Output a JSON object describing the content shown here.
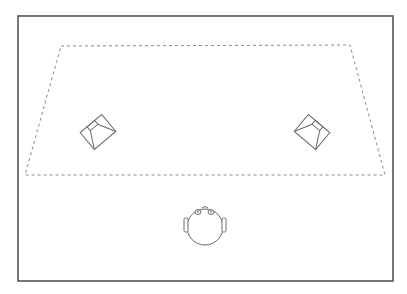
{
  "diagram": {
    "title": "",
    "type": "stereo listening setup (top view)",
    "colors": {
      "background": "#ffffff",
      "room_border": "#555555",
      "dashed_area": "#8a8a8a",
      "stroke": "#6a6a6a"
    },
    "room": {
      "x": 18,
      "y": 16,
      "width": 375,
      "height": 265
    },
    "listening_area": {
      "shape": "trapezoid",
      "style": "dashed",
      "points": [
        [
          61,
          46
        ],
        [
          350,
          45
        ],
        [
          385,
          175
        ],
        [
          25,
          175
        ]
      ]
    },
    "speakers": [
      {
        "id": "left-speaker",
        "cx": 98,
        "cy": 132,
        "rotation": -40
      },
      {
        "id": "right-speaker",
        "cx": 312,
        "cy": 132,
        "rotation": 40
      }
    ],
    "listener": {
      "id": "listener-head",
      "cx": 205,
      "cy": 227,
      "r": 18
    }
  }
}
